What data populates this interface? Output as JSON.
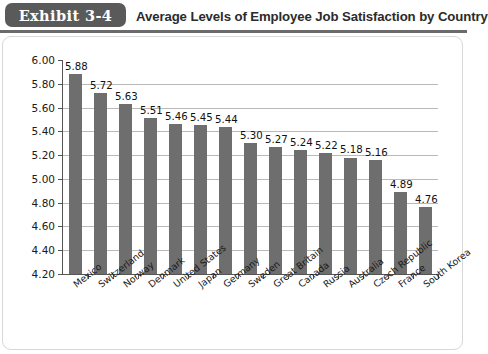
{
  "header": {
    "badge": "Exhibit 3-4",
    "title": "Average Levels of Employee Job Satisfaction by Country"
  },
  "colors": {
    "badge_bg": "#5a5a5a",
    "bar": "#6e6e6e",
    "gridline": "#b9b9b9",
    "axis": "#555555",
    "rule": "#6b6b6b"
  },
  "chart_data": {
    "type": "bar",
    "title": "Average Levels of Employee Job Satisfaction by Country",
    "xlabel": "",
    "ylabel": "",
    "ylim": [
      4.2,
      6.0
    ],
    "ytick_step": 0.2,
    "ytick_labels": [
      "6.00",
      "5.80",
      "5.60",
      "5.40",
      "5.20",
      "5.00",
      "4.80",
      "4.60",
      "4.40",
      "4.20"
    ],
    "grid": true,
    "legend": false,
    "categories": [
      "Mexico",
      "Switzerland",
      "Norway",
      "Denmark",
      "United States",
      "Japan",
      "Germany",
      "Sweden",
      "Great Britain",
      "Canada",
      "Russia",
      "Australia",
      "Czech Republic",
      "France",
      "South Korea"
    ],
    "values": [
      5.88,
      5.72,
      5.63,
      5.51,
      5.46,
      5.45,
      5.44,
      5.3,
      5.27,
      5.24,
      5.22,
      5.18,
      5.16,
      4.89,
      4.76
    ],
    "value_labels": [
      "5.88",
      "5.72",
      "5.63",
      "5.51",
      "5.46",
      "5.45",
      "5.44",
      "5.30",
      "5.27",
      "5.24",
      "5.22",
      "5.18",
      "5.16",
      "4.89",
      "4.76"
    ]
  }
}
